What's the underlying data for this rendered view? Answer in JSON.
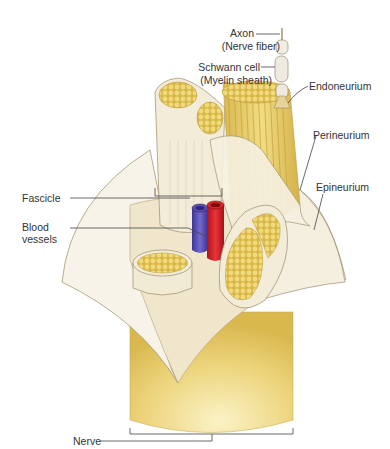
{
  "diagram": {
    "labels": {
      "axon_line1": "Axon",
      "axon_line2": "(Nerve fiber)",
      "schwann_line1": "Schwann cell",
      "schwann_line2": "(Myelin sheath)",
      "endoneurium": "Endoneurium",
      "perineurium": "Perineurium",
      "epineurium": "Epineurium",
      "fascicle": "Fascicle",
      "blood_line1": "Blood",
      "blood_line2": "vessels",
      "nerve": "Nerve"
    },
    "colors": {
      "nerve_body": "#e8c860",
      "fiber_yellow": "#e9cf6a",
      "fiber_dot": "#f2dc82",
      "sheath_cream": "#f3ecd8",
      "epineurium": "#f7f3e8",
      "outline": "#9c8d6a",
      "artery_red": "#d8262b",
      "vein_blue": "#5a4fb5",
      "leader_line": "#444444",
      "label_text": "#333333"
    }
  }
}
